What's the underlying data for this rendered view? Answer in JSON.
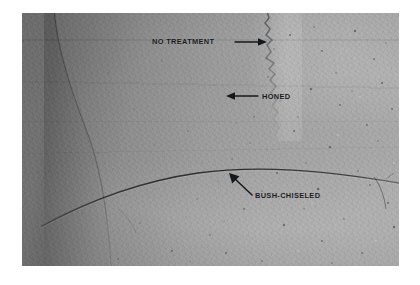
{
  "figure": {
    "kind": "photograph",
    "background_color": "#ffffff",
    "photo": {
      "x": 22,
      "y": 13,
      "width": 377,
      "height": 253,
      "tone": "grayscale",
      "description": "Grayscale photograph of a concrete slab surface divided into three differently finished zones, crossed by a long curved crack."
    }
  },
  "annotations": [
    {
      "id": "no-treatment",
      "label": "NO TREATMENT",
      "arrow": "right-arrow-icon",
      "arrow_direction": "right",
      "text_color": "#16191c"
    },
    {
      "id": "honed",
      "label": "HONED",
      "arrow": "left-arrow-icon",
      "arrow_direction": "left",
      "text_color": "#16191c"
    },
    {
      "id": "bush-chiseled",
      "label": "BUSH-CHISELED",
      "arrow": "diagonal-arrow-icon",
      "arrow_direction": "up-left",
      "text_color": "#16191c"
    }
  ],
  "features": {
    "crack": "long-curved-crack",
    "seam": "jagged-vertical-seam",
    "slab_edge": "dark-diagonal-slab-edge",
    "left_strip": "light-vertical-strip"
  }
}
